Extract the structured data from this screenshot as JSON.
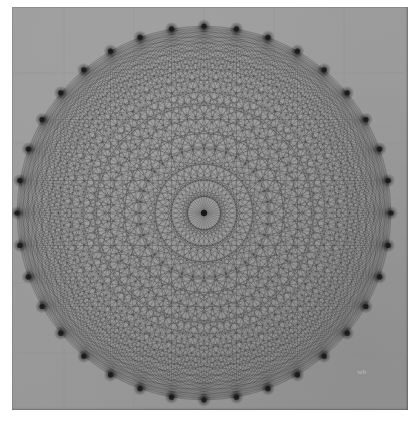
{
  "artwork": {
    "title": "Mystic Rose",
    "subtitle": "Complete graph on a regular polygon",
    "medium": "ink on gray graph paper",
    "signature": "wb"
  },
  "canvas": {
    "width": 410,
    "height": 422,
    "background_color": "#ffffff"
  },
  "paper": {
    "left": 12,
    "top": 7,
    "width": 396,
    "height": 403,
    "color": "#9b9b9b",
    "edge_color": "#787878"
  },
  "grid": {
    "visible": true,
    "color": "#8a8a8a",
    "opacity": 0.55,
    "spacing": 70,
    "origin_x": 204,
    "origin_y": 213,
    "line_width": 0.5
  },
  "chart_data": {
    "type": "scatter",
    "xlabel": "",
    "ylabel": "",
    "vertex_count": 36,
    "center_x": 204,
    "center_y": 213,
    "radius": 187,
    "start_angle_deg": -90,
    "edge_color": "#2a2a2a",
    "edge_opacity": 0.62,
    "edge_width": 0.42,
    "edge_total": 630,
    "hub_radius": 21,
    "ring_radii": [
      21,
      63,
      110,
      150,
      187
    ],
    "vertex_dot_radius": 2.6,
    "vertex_dot_color": "#1c1c1c",
    "vertex_halo_radius": 7
  }
}
